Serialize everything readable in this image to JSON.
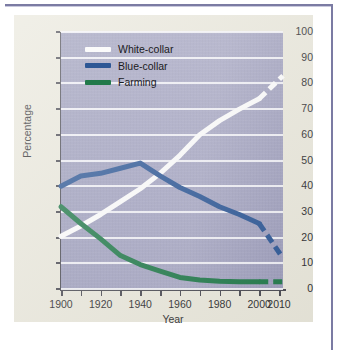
{
  "figure": {
    "panel_background": "#e9e7db",
    "plot_background": "#a2a2c0",
    "frame_color": "#7b7ba3"
  },
  "chart_data": {
    "type": "line",
    "title": "",
    "xlabel": "Year",
    "ylabel": "Percentage",
    "xlim": [
      1900,
      2012
    ],
    "ylim": [
      0,
      100
    ],
    "grid": true,
    "legend_position": "top-left inside plot",
    "xticks": [
      1900,
      1910,
      1920,
      1930,
      1940,
      1950,
      1960,
      1970,
      1980,
      1990,
      2000,
      2010
    ],
    "xtick_labels": [
      "1900",
      "",
      "1920",
      "",
      "1940",
      "",
      "1960",
      "",
      "1980",
      "",
      "2000",
      "2010"
    ],
    "yticks": [
      0,
      10,
      20,
      30,
      40,
      50,
      60,
      70,
      80,
      90,
      100
    ],
    "ytick_labels": [
      "0",
      "10",
      "20",
      "30",
      "40",
      "50",
      "60",
      "70",
      "80",
      "90",
      "100"
    ],
    "series": [
      {
        "name": "White-collar",
        "color": "#fbfbfb",
        "x": [
          1900,
          1910,
          1920,
          1930,
          1940,
          1950,
          1960,
          1970,
          1980,
          1990,
          2000
        ],
        "values": [
          20.5,
          24.5,
          29,
          34,
          39,
          45,
          52,
          60,
          65.5,
          70,
          74
        ],
        "projected_x": [
          2000,
          2004,
          2008,
          2012
        ],
        "projected_values": [
          74,
          77,
          80,
          83
        ]
      },
      {
        "name": "Blue-collar",
        "color": "#2d5795",
        "x": [
          1900,
          1910,
          1920,
          1930,
          1940,
          1950,
          1960,
          1970,
          1980,
          1990,
          2000
        ],
        "values": [
          40,
          44,
          45,
          47,
          49,
          44,
          39.5,
          36,
          32,
          29,
          25.5
        ],
        "projected_x": [
          2000,
          2004,
          2008,
          2012
        ],
        "projected_values": [
          25.5,
          21,
          16.5,
          12
        ]
      },
      {
        "name": "Farming",
        "color": "#21794a",
        "x": [
          1900,
          1910,
          1920,
          1930,
          1940,
          1950,
          1960,
          1970,
          1980,
          1990,
          2000
        ],
        "values": [
          32,
          25.5,
          19.5,
          13,
          9.5,
          7,
          4.5,
          3.5,
          3,
          2.8,
          2.8
        ],
        "projected_x": [
          2000,
          2004,
          2008,
          2012
        ],
        "projected_values": [
          2.8,
          2.8,
          2.8,
          2.8
        ]
      }
    ]
  },
  "legend": {
    "items": [
      {
        "label": "White-collar",
        "color": "#fbfbfb"
      },
      {
        "label": "Blue-collar",
        "color": "#2d5795"
      },
      {
        "label": "Farming",
        "color": "#21794a"
      }
    ]
  }
}
